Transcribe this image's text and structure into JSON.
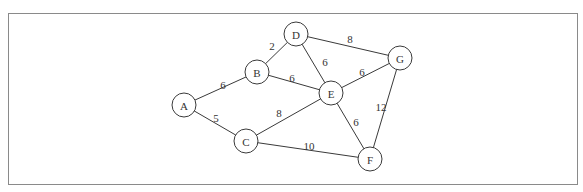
{
  "diagram": {
    "type": "weighted-undirected-graph",
    "frame": {
      "border_color": "#8a8a8a"
    },
    "nodes": [
      {
        "id": "A",
        "label": "A",
        "x": 184,
        "y": 105
      },
      {
        "id": "B",
        "label": "B",
        "x": 257,
        "y": 72
      },
      {
        "id": "C",
        "label": "C",
        "x": 246,
        "y": 141
      },
      {
        "id": "D",
        "label": "D",
        "x": 296,
        "y": 34
      },
      {
        "id": "E",
        "label": "E",
        "x": 331,
        "y": 93
      },
      {
        "id": "F",
        "label": "F",
        "x": 370,
        "y": 159
      },
      {
        "id": "G",
        "label": "G",
        "x": 400,
        "y": 58
      }
    ],
    "edges": [
      {
        "from": "A",
        "to": "B",
        "weight": "6",
        "lx": 223,
        "ly": 85
      },
      {
        "from": "A",
        "to": "C",
        "weight": "5",
        "lx": 216,
        "ly": 118
      },
      {
        "from": "B",
        "to": "D",
        "weight": "2",
        "lx": 272,
        "ly": 46
      },
      {
        "from": "B",
        "to": "E",
        "weight": "6",
        "lx": 292,
        "ly": 78
      },
      {
        "from": "D",
        "to": "E",
        "weight": "6",
        "lx": 325,
        "ly": 62
      },
      {
        "from": "D",
        "to": "G",
        "weight": "8",
        "lx": 350,
        "ly": 39
      },
      {
        "from": "C",
        "to": "E",
        "weight": "8",
        "lx": 279,
        "ly": 113
      },
      {
        "from": "E",
        "to": "G",
        "weight": "6",
        "lx": 362,
        "ly": 72
      },
      {
        "from": "E",
        "to": "F",
        "weight": "6",
        "lx": 356,
        "ly": 122
      },
      {
        "from": "C",
        "to": "F",
        "weight": "10",
        "lx": 309,
        "ly": 146
      },
      {
        "from": "G",
        "to": "F",
        "weight": "12",
        "lx": 381,
        "ly": 107
      }
    ],
    "node_radius": 12,
    "colors": {
      "stroke": "#3a3a3a",
      "text": "#333333",
      "fill": "#ffffff"
    }
  }
}
